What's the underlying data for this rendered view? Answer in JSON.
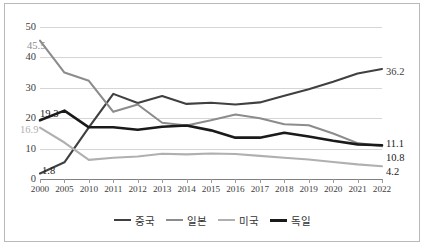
{
  "chart_data": {
    "type": "line",
    "title": "",
    "xlabel": "",
    "ylabel": "",
    "ylim": [
      0,
      50
    ],
    "yticks": [
      0,
      10,
      20,
      30,
      40,
      50
    ],
    "grid": true,
    "legend_position": "bottom",
    "categories": [
      "2000",
      "2005",
      "2010",
      "2011",
      "2012",
      "2013",
      "2014",
      "2015",
      "2016",
      "2017",
      "2018",
      "2019",
      "2020",
      "2021",
      "2022"
    ],
    "series": [
      {
        "name": "중국",
        "color": "#404040",
        "width": 2.1,
        "values": [
          1.8,
          5.5,
          17.0,
          28.0,
          25.0,
          27.3,
          24.7,
          25.1,
          24.5,
          25.2,
          27.4,
          29.5,
          32.0,
          34.7,
          36.2
        ],
        "start_label": "1.8",
        "end_label": "36.2"
      },
      {
        "name": "일본",
        "color": "#8c8c8c",
        "width": 2.1,
        "values": [
          45.5,
          35.0,
          32.3,
          22.1,
          24.5,
          18.5,
          17.6,
          19.3,
          21.2,
          20.0,
          18.0,
          17.7,
          15.0,
          11.8,
          10.8
        ],
        "start_label": "45.5",
        "end_label": "10.8"
      },
      {
        "name": "미국",
        "color": "#b0b0b0",
        "width": 2.1,
        "values": [
          16.9,
          12.0,
          6.3,
          7.0,
          7.4,
          8.3,
          8.1,
          8.4,
          8.2,
          7.6,
          7.0,
          6.4,
          5.6,
          4.8,
          4.2
        ],
        "start_label": "16.9",
        "end_label": "4.2"
      },
      {
        "name": "독일",
        "color": "#1a1a1a",
        "width": 2.6,
        "values": [
          19.3,
          22.5,
          17.0,
          17.0,
          16.2,
          17.2,
          17.6,
          16.0,
          13.6,
          13.6,
          15.2,
          14.0,
          12.6,
          11.4,
          11.1
        ],
        "start_label": "19.3",
        "end_label": "11.1"
      }
    ],
    "annotations": [
      {
        "text": "45.5",
        "color": "#8c8c8c",
        "x": 27,
        "y": 40
      },
      {
        "text": "19.3",
        "color": "#1a1a1a",
        "x": 40,
        "y": 108
      },
      {
        "text": "16.9",
        "color": "#b0b0b0",
        "x": 20,
        "y": 124
      },
      {
        "text": "1.8",
        "color": "#1a1a1a",
        "x": 42,
        "y": 165
      },
      {
        "text": "36.2",
        "color": "#404040",
        "x": 386,
        "y": 66
      },
      {
        "text": "11.1",
        "color": "#1a1a1a",
        "x": 386,
        "y": 138
      },
      {
        "text": "10.8",
        "color": "#1a1a1a",
        "x": 386,
        "y": 152
      },
      {
        "text": "4.2",
        "color": "#1a1a1a",
        "x": 386,
        "y": 166
      }
    ]
  },
  "legend": {
    "items": [
      {
        "label": "중국",
        "color": "#404040",
        "width": 2.2
      },
      {
        "label": "일본",
        "color": "#8c8c8c",
        "width": 2.2
      },
      {
        "label": "미국",
        "color": "#b0b0b0",
        "width": 2.2
      },
      {
        "label": "독일",
        "color": "#1a1a1a",
        "width": 3.0
      }
    ]
  }
}
